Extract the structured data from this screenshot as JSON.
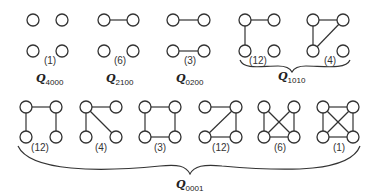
{
  "diagram": {
    "node_radius": 6,
    "graphs": [
      {
        "id": "g4000",
        "count": "(1)",
        "nodes": [
          [
            33,
            20
          ],
          [
            62,
            20
          ],
          [
            33,
            51
          ],
          [
            62,
            51
          ]
        ],
        "edges": [],
        "label_pos": [
          50,
          64
        ]
      },
      {
        "id": "g2100",
        "count": "(6)",
        "nodes": [
          [
            104,
            20
          ],
          [
            133,
            20
          ],
          [
            104,
            51
          ],
          [
            133,
            51
          ]
        ],
        "edges": [
          [
            0,
            1
          ]
        ],
        "label_pos": [
          120,
          64
        ]
      },
      {
        "id": "g0200",
        "count": "(3)",
        "nodes": [
          [
            173,
            20
          ],
          [
            204,
            20
          ],
          [
            173,
            51
          ],
          [
            204,
            51
          ]
        ],
        "edges": [
          [
            0,
            1
          ],
          [
            2,
            3
          ]
        ],
        "label_pos": [
          190,
          64
        ]
      },
      {
        "id": "g1010a",
        "count": "(12)",
        "nodes": [
          [
            245,
            20
          ],
          [
            274,
            20
          ],
          [
            245,
            51
          ],
          [
            274,
            51
          ]
        ],
        "edges": [
          [
            0,
            1
          ],
          [
            0,
            2
          ]
        ],
        "label_pos": [
          258,
          64
        ]
      },
      {
        "id": "g1010b",
        "count": "(4)",
        "nodes": [
          [
            313,
            20
          ],
          [
            343,
            20
          ],
          [
            313,
            51
          ],
          [
            343,
            51
          ]
        ],
        "edges": [
          [
            0,
            1
          ],
          [
            0,
            2
          ],
          [
            1,
            2
          ]
        ],
        "label_pos": [
          330,
          64
        ]
      },
      {
        "id": "g0001a",
        "count": "(12)",
        "nodes": [
          [
            26,
            107
          ],
          [
            56,
            107
          ],
          [
            26,
            137
          ],
          [
            56,
            137
          ]
        ],
        "edges": [
          [
            0,
            1
          ],
          [
            0,
            2
          ],
          [
            1,
            3
          ]
        ],
        "label_pos": [
          40,
          151
        ]
      },
      {
        "id": "g0001b",
        "count": "(4)",
        "nodes": [
          [
            86,
            107
          ],
          [
            116,
            107
          ],
          [
            86,
            137
          ],
          [
            116,
            137
          ]
        ],
        "edges": [
          [
            0,
            1
          ],
          [
            0,
            2
          ],
          [
            0,
            3
          ]
        ],
        "label_pos": [
          101,
          151
        ]
      },
      {
        "id": "g0001c",
        "count": "(3)",
        "nodes": [
          [
            145,
            107
          ],
          [
            175,
            107
          ],
          [
            145,
            137
          ],
          [
            175,
            137
          ]
        ],
        "edges": [
          [
            0,
            1
          ],
          [
            0,
            2
          ],
          [
            1,
            3
          ],
          [
            2,
            3
          ]
        ],
        "label_pos": [
          160,
          151
        ]
      },
      {
        "id": "g0001d",
        "count": "(12)",
        "nodes": [
          [
            205,
            107
          ],
          [
            236,
            107
          ],
          [
            205,
            137
          ],
          [
            236,
            137
          ]
        ],
        "edges": [
          [
            0,
            1
          ],
          [
            1,
            2
          ],
          [
            1,
            3
          ],
          [
            2,
            3
          ]
        ],
        "label_pos": [
          221,
          151
        ]
      },
      {
        "id": "g0001e",
        "count": "(6)",
        "nodes": [
          [
            264,
            107
          ],
          [
            294,
            107
          ],
          [
            264,
            137
          ],
          [
            294,
            137
          ]
        ],
        "edges": [
          [
            0,
            2
          ],
          [
            0,
            3
          ],
          [
            1,
            2
          ],
          [
            1,
            3
          ],
          [
            2,
            3
          ]
        ],
        "label_pos": [
          280,
          151
        ]
      },
      {
        "id": "g0001f",
        "count": "(1)",
        "nodes": [
          [
            323,
            107
          ],
          [
            353,
            107
          ],
          [
            323,
            137
          ],
          [
            353,
            137
          ]
        ],
        "edges": [
          [
            0,
            1
          ],
          [
            0,
            2
          ],
          [
            0,
            3
          ],
          [
            1,
            2
          ],
          [
            1,
            3
          ],
          [
            2,
            3
          ]
        ],
        "label_pos": [
          339,
          151
        ]
      }
    ],
    "class_labels": [
      {
        "id": "Q4000",
        "main": "Q",
        "sub": "4000",
        "pos": [
          36,
          82
        ]
      },
      {
        "id": "Q2100",
        "main": "Q",
        "sub": "2100",
        "pos": [
          106,
          82
        ]
      },
      {
        "id": "Q0200",
        "main": "Q",
        "sub": "0200",
        "pos": [
          176,
          82
        ]
      },
      {
        "id": "Q1010",
        "main": "Q",
        "sub": "1010",
        "pos": [
          278,
          80
        ]
      },
      {
        "id": "Q0001",
        "main": "Q",
        "sub": "0001",
        "pos": [
          176,
          188
        ]
      }
    ],
    "braces": [
      {
        "id": "brace-Q1010",
        "path": "M 240 60 C 244 70, 262 66, 278 66 C 286 66, 290 68, 292 72 C 294 68, 298 66, 306 66 C 322 66, 346 70, 350 60"
      },
      {
        "id": "brace-Q0001",
        "path": "M 18 146 C 30 172, 100 172, 160 166 C 178 164, 186 166, 190 174 C 194 166, 204 164, 222 166 C 290 172, 350 172, 360 146"
      }
    ]
  }
}
